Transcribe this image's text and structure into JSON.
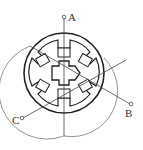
{
  "diagram": {
    "phases": [
      {
        "id": "A",
        "label": "A"
      },
      {
        "id": "B",
        "label": "B"
      },
      {
        "id": "C",
        "label": "C"
      }
    ],
    "stator_poles": 6,
    "rotor_teeth": 4,
    "colors": {
      "stroke": "#222222",
      "winding": "#666666",
      "background": "#ffffff"
    }
  }
}
